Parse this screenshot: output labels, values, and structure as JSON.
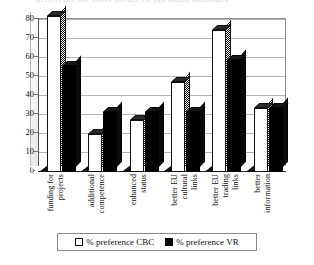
{
  "title_sliver": "preference for cross-border co-operation outcomes",
  "chart_data": {
    "type": "bar",
    "title": "",
    "xlabel": "",
    "ylabel": "",
    "ylim": [
      0,
      80
    ],
    "yticks": [
      0,
      10,
      20,
      30,
      40,
      50,
      60,
      70,
      80
    ],
    "ytick_labels": [
      "0",
      "10",
      "20",
      "30",
      "40",
      "50",
      "60",
      "70",
      "80"
    ],
    "grid": true,
    "legend_position": "bottom",
    "style": "3d-column",
    "categories": [
      "funding for projects",
      "additional competence",
      "enhanced status",
      "better EU cultural links",
      "better EU trading links",
      "better information"
    ],
    "category_lines": [
      [
        "funding for",
        "projects"
      ],
      [
        "additional",
        "competence"
      ],
      [
        "enhanced",
        "status"
      ],
      [
        "better EU",
        "cultural",
        "links"
      ],
      [
        "better EU",
        "trading",
        "links"
      ],
      [
        "better",
        "information"
      ]
    ],
    "series": [
      {
        "name": "% preference CBC",
        "color": "#ffffff",
        "values": [
          81,
          20,
          27,
          47,
          74,
          33
        ]
      },
      {
        "name": "% preference VR",
        "color": "#000000",
        "values": [
          55,
          31,
          31,
          31,
          58,
          33
        ]
      }
    ]
  },
  "legend": {
    "items": [
      {
        "label": "% preference CBC",
        "swatch": "white-square-icon"
      },
      {
        "label": "% preference VR",
        "swatch": "black-square-icon"
      }
    ]
  }
}
